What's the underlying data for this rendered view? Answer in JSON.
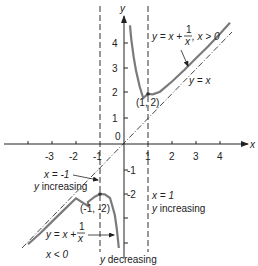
{
  "diagram": {
    "axes": {
      "x_label": "x",
      "y_label": "y",
      "origin_label": "0",
      "x_ticks": [
        "-3",
        "-2",
        "-1",
        "1",
        "2",
        "3",
        "4"
      ],
      "y_ticks": [
        "4",
        "3",
        "2",
        "1",
        "-1",
        "-2",
        "-3",
        "-4"
      ]
    },
    "curves": {
      "right_branch_label": "y = x + 1/x, x > 0",
      "right_branch_main": "y = x +",
      "right_branch_num": "1",
      "right_branch_den": "x",
      "right_branch_cond": ", x > 0",
      "left_branch_main": "y = x +",
      "left_branch_num": "1",
      "left_branch_den": "x",
      "left_branch_cond": "x < 0",
      "asymptote_label": "y = x"
    },
    "points": {
      "min_label": "(1, 2)",
      "max_label": "(-1, -2)"
    },
    "annotations": {
      "left_line_1": "x = -1",
      "left_line_2": "y increasing",
      "right_line_1": "x = 1",
      "right_line_2": "y increasing",
      "bottom": "y decreasing"
    },
    "colors": {
      "curve": "#7a7a7a",
      "axis": "#222222",
      "dash": "#333333"
    }
  }
}
